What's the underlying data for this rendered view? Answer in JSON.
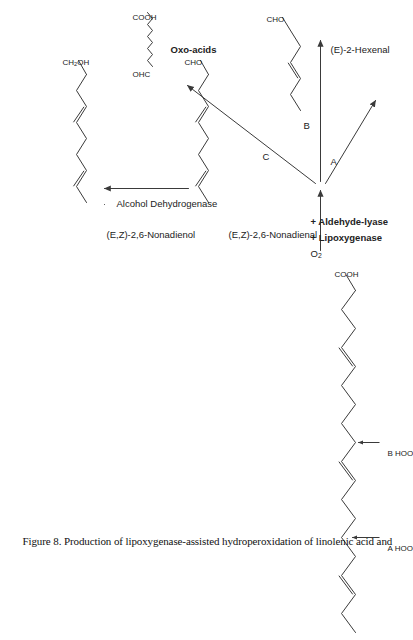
{
  "figure": {
    "caption": "Figure 8.  Production of lipoxygenase-assisted hydroperoxidation of linolenic acid and",
    "caption_number": "Figure 8.",
    "background_color": "#ffffff",
    "line_color": "#3a3a3a"
  },
  "substrate": {
    "name_label": "COOH",
    "hydroperoxide_a": "HOO",
    "hydroperoxide_a_tag": "A",
    "hydroperoxide_b": "HOO",
    "hydroperoxide_b_tag": "B"
  },
  "reagents": {
    "oxygen": "O2",
    "oxygen_base": "O",
    "oxygen_sub": "2",
    "enzyme_1": "+ Lipoxygenase",
    "enzyme_2": "+ Aldehyde-lyase"
  },
  "branches": [
    {
      "id": "a",
      "label": "A"
    },
    {
      "id": "b",
      "label": "B"
    },
    {
      "id": "c",
      "label": "C"
    }
  ],
  "products": {
    "hexenal": {
      "terminal_group": "CHO",
      "name": "(E)-2-Hexenal"
    },
    "nonadienal": {
      "terminal_group": "CHO",
      "name": "(E,Z)-2,6-Nonadienal"
    },
    "nonadienol": {
      "terminal_group_base": "CH",
      "terminal_group_sub": "2",
      "terminal_group_tail": "OH",
      "terminal_group": "CH2OH",
      "name": "(E,Z)-2,6-Nonadienol"
    },
    "oxoacids": {
      "formula_left": "OHC",
      "formula_right": "COOH",
      "name": "Oxo-acids"
    }
  },
  "enzyme_step": {
    "label": "Alcohol Dehydrogenase"
  }
}
